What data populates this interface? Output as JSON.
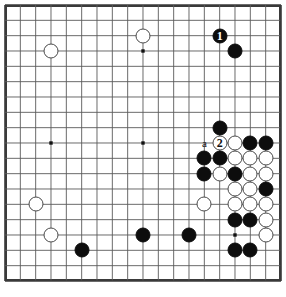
{
  "diagram": {
    "kind": "go-board-diagram",
    "board_size": 19,
    "caption": "",
    "colors": {
      "black_stone": "#0d0d0d",
      "white_stone": "#ffffff",
      "white_stone_outline": "#4a4a4a",
      "grid_line": "#5a5a5a",
      "board_border": "#3a3a3a",
      "board_background": "#ffffff",
      "black_label_text": "#ffffff",
      "white_label_text": "#111111"
    },
    "geometry": {
      "origin_x": 5,
      "origin_y": 5,
      "spacing": 15.333,
      "stone_diameter": 15,
      "board_px": 276
    },
    "star_points": [
      {
        "col": 3,
        "row": 3
      },
      {
        "col": 9,
        "row": 3
      },
      {
        "col": 15,
        "row": 3
      },
      {
        "col": 3,
        "row": 9
      },
      {
        "col": 9,
        "row": 9
      },
      {
        "col": 15,
        "row": 9
      },
      {
        "col": 3,
        "row": 15
      },
      {
        "col": 9,
        "row": 15
      },
      {
        "col": 15,
        "row": 15
      }
    ],
    "stones": [
      {
        "color": "black",
        "col": 14,
        "row": 2,
        "label": "1"
      },
      {
        "color": "black",
        "col": 15,
        "row": 3,
        "label": ""
      },
      {
        "color": "white",
        "col": 9,
        "row": 2,
        "label": ""
      },
      {
        "color": "white",
        "col": 3,
        "row": 3,
        "label": ""
      },
      {
        "color": "black",
        "col": 14,
        "row": 8,
        "label": ""
      },
      {
        "color": "white",
        "col": 14,
        "row": 9,
        "label": "2"
      },
      {
        "color": "white",
        "col": 15,
        "row": 9,
        "label": ""
      },
      {
        "color": "black",
        "col": 16,
        "row": 9,
        "label": ""
      },
      {
        "color": "black",
        "col": 17,
        "row": 9,
        "label": ""
      },
      {
        "color": "black",
        "col": 13,
        "row": 10,
        "label": ""
      },
      {
        "color": "black",
        "col": 14,
        "row": 10,
        "label": ""
      },
      {
        "color": "white",
        "col": 15,
        "row": 10,
        "label": ""
      },
      {
        "color": "white",
        "col": 16,
        "row": 10,
        "label": ""
      },
      {
        "color": "white",
        "col": 17,
        "row": 10,
        "label": ""
      },
      {
        "color": "black",
        "col": 13,
        "row": 11,
        "label": ""
      },
      {
        "color": "white",
        "col": 14,
        "row": 11,
        "label": ""
      },
      {
        "color": "black",
        "col": 15,
        "row": 11,
        "label": ""
      },
      {
        "color": "white",
        "col": 16,
        "row": 11,
        "label": ""
      },
      {
        "color": "white",
        "col": 17,
        "row": 11,
        "label": ""
      },
      {
        "color": "white",
        "col": 15,
        "row": 12,
        "label": ""
      },
      {
        "color": "white",
        "col": 16,
        "row": 12,
        "label": ""
      },
      {
        "color": "black",
        "col": 17,
        "row": 12,
        "label": ""
      },
      {
        "color": "white",
        "col": 2,
        "row": 13,
        "label": ""
      },
      {
        "color": "white",
        "col": 13,
        "row": 13,
        "label": ""
      },
      {
        "color": "white",
        "col": 15,
        "row": 13,
        "label": ""
      },
      {
        "color": "white",
        "col": 16,
        "row": 13,
        "label": ""
      },
      {
        "color": "white",
        "col": 17,
        "row": 13,
        "label": ""
      },
      {
        "color": "black",
        "col": 15,
        "row": 14,
        "label": ""
      },
      {
        "color": "black",
        "col": 16,
        "row": 14,
        "label": ""
      },
      {
        "color": "white",
        "col": 17,
        "row": 14,
        "label": ""
      },
      {
        "color": "white",
        "col": 3,
        "row": 15,
        "label": ""
      },
      {
        "color": "black",
        "col": 9,
        "row": 15,
        "label": ""
      },
      {
        "color": "black",
        "col": 12,
        "row": 15,
        "label": ""
      },
      {
        "color": "white",
        "col": 17,
        "row": 15,
        "label": ""
      },
      {
        "color": "black",
        "col": 5,
        "row": 16,
        "label": ""
      },
      {
        "color": "black",
        "col": 15,
        "row": 16,
        "label": ""
      },
      {
        "color": "black",
        "col": 16,
        "row": 16,
        "label": ""
      }
    ],
    "point_labels": [
      {
        "text": "a",
        "col": 13,
        "row": 9
      }
    ]
  }
}
